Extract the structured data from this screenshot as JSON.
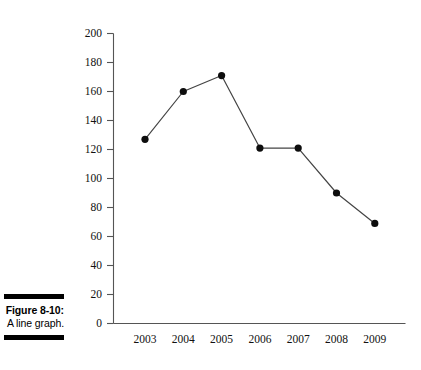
{
  "figure": {
    "caption_number": "Figure 8-10:",
    "caption_title": "A line graph."
  },
  "chart_data": {
    "type": "line",
    "title": "",
    "subtitle": "",
    "xlabel": "",
    "ylabel": "",
    "categories": [
      "2003",
      "2004",
      "2005",
      "2006",
      "2007",
      "2008",
      "2009"
    ],
    "values": [
      127,
      160,
      171,
      121,
      121,
      90,
      69
    ],
    "series": [
      {
        "name": "",
        "values": [
          127,
          160,
          171,
          121,
          121,
          90,
          69
        ]
      }
    ],
    "ylim": [
      0,
      200
    ],
    "ytick_step": 20,
    "yticks": [
      0,
      20,
      40,
      60,
      80,
      100,
      120,
      140,
      160,
      180,
      200
    ],
    "ytick_labels": [
      "0",
      "20",
      "40",
      "60",
      "80",
      "100",
      "120",
      "140",
      "160",
      "180",
      "200"
    ],
    "xtick_labels": [
      "2003",
      "2004",
      "2005",
      "2006",
      "2007",
      "2008",
      "2009"
    ],
    "grid": false,
    "legend": false,
    "legend_position": "none",
    "marker": "filled-circle",
    "line_color": "#444444",
    "marker_color": "#0d0d0d",
    "axis_color": "#555555",
    "background_color": "#ffffff"
  }
}
